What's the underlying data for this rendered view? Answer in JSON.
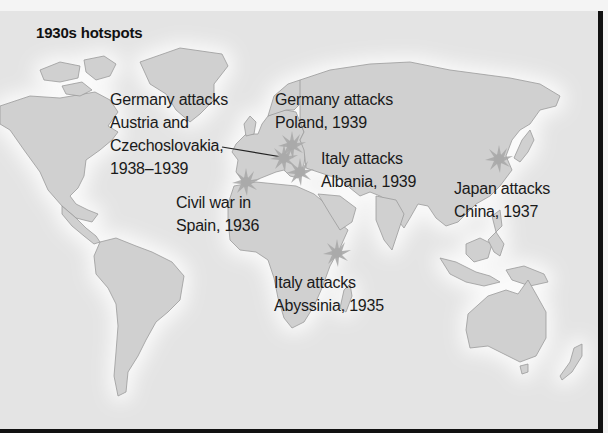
{
  "map": {
    "title": "1930s hotspots",
    "colors": {
      "ocean": "#e4e4e4",
      "land": "#d0d0d0",
      "coast": "#9a9a9a",
      "halo": "#f7f7f7",
      "marker": "#a8a8a8",
      "border": "#111111"
    },
    "annotations": [
      {
        "id": "austria-czech",
        "text": "Germany attacks\nAustria and\nCzechoslovakia,\n1938–1939"
      },
      {
        "id": "poland",
        "text": "Germany attacks\nPoland, 1939"
      },
      {
        "id": "albania",
        "text": "Italy attacks\nAlbania, 1939"
      },
      {
        "id": "spain",
        "text": "Civil war in\nSpain, 1936"
      },
      {
        "id": "abyssinia",
        "text": "Italy attacks\nAbyssinia, 1935"
      },
      {
        "id": "china",
        "text": "Japan attacks\nChina, 1937"
      }
    ],
    "markers": [
      {
        "name": "Spain",
        "x": 246,
        "y": 171
      },
      {
        "name": "Czechoslovakia",
        "x": 289,
        "y": 150
      },
      {
        "name": "Poland",
        "x": 292,
        "y": 132
      },
      {
        "name": "Austria",
        "x": 284,
        "y": 162
      },
      {
        "name": "Albania",
        "x": 300,
        "y": 169
      },
      {
        "name": "Abyssinia",
        "x": 337,
        "y": 242
      },
      {
        "name": "China",
        "x": 499,
        "y": 148
      }
    ]
  }
}
